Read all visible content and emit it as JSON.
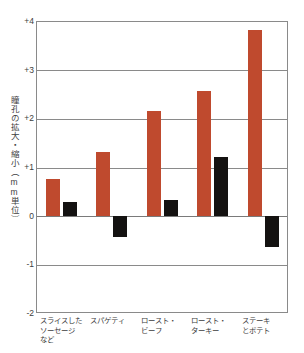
{
  "chart_data": {
    "type": "bar",
    "title": "",
    "subtitle": "",
    "xlabel": "",
    "ylabel": "瞳孔の拡大・縮小（mm単位）",
    "ylim": [
      -2,
      4
    ],
    "yticks": [
      "+4",
      "+3",
      "+2",
      "+1",
      "0",
      "-1",
      "-2"
    ],
    "ytick_values": [
      4,
      3,
      2,
      1,
      0,
      -1,
      -2
    ],
    "grid": true,
    "legend": "none",
    "categories": [
      "スライスした\nソーセージ\nなど",
      "スパゲティ",
      "ロースト・\nビーフ",
      "ロースト・\nターキー",
      "ステーキ\nとポテト"
    ],
    "categories_flat": [
      "スライスしたソーセージなど",
      "スパゲティ",
      "ロースト・ビーフ",
      "ロースト・ターキー",
      "ステーキとポテト"
    ],
    "series": [
      {
        "name": "series-red",
        "color": "#bf4a2e",
        "values": [
          0.76,
          1.31,
          2.15,
          2.56,
          3.82
        ]
      },
      {
        "name": "series-black",
        "color": "#141211",
        "values": [
          0.28,
          -0.43,
          0.33,
          1.21,
          -0.65
        ]
      }
    ]
  },
  "colors": {
    "red": "#bf4a2e",
    "black": "#141211",
    "axis": "#8a8a8a",
    "text": "#3d3d3d",
    "background": "#ffffff"
  }
}
